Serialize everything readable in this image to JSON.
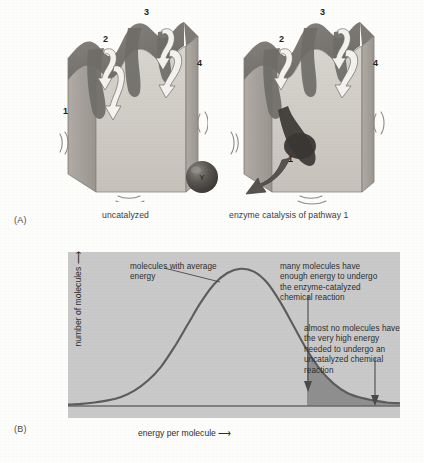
{
  "figure": {
    "panel_a": {
      "letter": "(A)",
      "caption_left": "uncatalyzed",
      "caption_right": "enzyme catalysis of pathway 1",
      "left_block_numbers": [
        "1",
        "2",
        "3",
        "4"
      ],
      "right_block_numbers": [
        "1",
        "2",
        "3",
        "4"
      ],
      "ball_label": "Y"
    },
    "panel_b": {
      "letter": "(B)",
      "y_axis_label": "number of molecules",
      "x_axis_label": "energy per molecule",
      "axis_arrow": "⟶",
      "annotation_peak": "molecules with average energy",
      "annotation_many": "many molecules have enough energy to undergo the enzyme-catalyzed chemical reaction",
      "annotation_almost": "almost no molecules have the very high energy needed to undergo an uncatalyzed chemical reaction"
    }
  },
  "colors": {
    "page_background": "#fdfdfc",
    "plot_background": "#c9c9c9",
    "curve": "#5c5c5c",
    "tail_shade": "#8f8f8f",
    "block_face_light": "#d2cfc9",
    "block_face_mid": "#b4b0a9",
    "block_face_dark": "#8d8a84",
    "groove_dark": "#6f6c67",
    "arrow_white": "#f2f0ec",
    "ball": "#4a4744",
    "text": "#2e2e2e"
  },
  "chart_data": {
    "type": "line",
    "title": "",
    "xlabel": "energy per molecule",
    "ylabel": "number of molecules",
    "grid": false,
    "legend": "none",
    "xlim": [
      0,
      100
    ],
    "ylim": [
      0,
      100
    ],
    "axis_ticks": "none",
    "series": [
      {
        "name": "number of molecules vs energy per molecule",
        "x": [
          0,
          4,
          8,
          12,
          16,
          20,
          24,
          28,
          32,
          36,
          40,
          44,
          48,
          52,
          56,
          60,
          64,
          68,
          72,
          76,
          80,
          84,
          88,
          92,
          96,
          100
        ],
        "y": [
          1,
          1.5,
          2.5,
          4,
          6.5,
          11,
          18,
          28,
          42,
          58,
          74,
          87,
          95,
          98,
          96,
          88,
          74,
          57,
          40,
          26,
          16,
          9.5,
          6,
          4,
          2.5,
          2
        ]
      }
    ],
    "annotations": [
      {
        "text": "molecules with average energy",
        "points_to_x": 50,
        "points_to_y": 98,
        "label_x": 14,
        "label_y": 105
      },
      {
        "text": "many molecules have enough energy to undergo the enzyme-catalyzed chemical reaction",
        "marker": "vertical-arrow",
        "arrow_at_x": 72,
        "arrow_from_y": 72,
        "arrow_to_y": 12
      },
      {
        "text": "almost no molecules have the very high energy needed to undergo an uncatalyzed chemical reaction",
        "marker": "vertical-arrow",
        "arrow_at_x": 93,
        "arrow_from_y": 48,
        "arrow_to_y": 4
      }
    ],
    "shaded_regions": [
      {
        "name": "high-energy tail",
        "x_start": 72,
        "x_end": 100,
        "fill": "#8f8f8f"
      }
    ]
  }
}
